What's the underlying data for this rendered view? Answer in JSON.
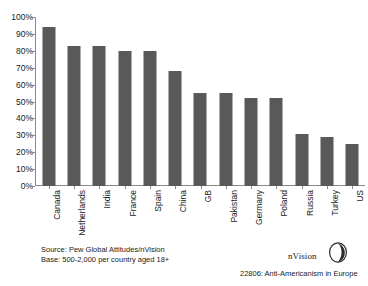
{
  "chart_data": {
    "type": "bar",
    "title": "",
    "xlabel": "",
    "ylabel": "",
    "ylim": [
      0,
      100
    ],
    "grid": false,
    "legend": "none",
    "y_ticks": [
      "100%",
      "90%",
      "80%",
      "70%",
      "60%",
      "50%",
      "40%",
      "30%",
      "20%",
      "10%",
      "0%"
    ],
    "y_tick_values": [
      100,
      90,
      80,
      70,
      60,
      50,
      40,
      30,
      20,
      10,
      0
    ],
    "categories": [
      "Canada",
      "Netherlands",
      "India",
      "France",
      "Spain",
      "China",
      "GB",
      "Pakistan",
      "Germany",
      "Poland",
      "Russia",
      "Turkey",
      "US"
    ],
    "values": [
      94,
      83,
      83,
      80,
      80,
      68,
      55,
      55,
      52,
      52,
      31,
      29,
      25
    ],
    "bar_color": "#595959",
    "axis_color": "#8a8a8a"
  },
  "footer": {
    "source_line_1": "Source: Pew Global Attitudes/nVision",
    "source_line_2": "Base: 500-2,000 per country aged 18+",
    "logo_text": "nVision",
    "caption": "22806: Anti-Americanism in Europe"
  }
}
